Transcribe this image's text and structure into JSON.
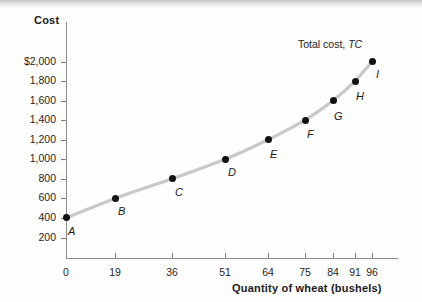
{
  "chart_data": {
    "type": "line",
    "title": "",
    "xlabel": "Quantity of wheat (bushels)",
    "ylabel": "Cost",
    "series_label": "Total cost,",
    "series_symbol": "TC",
    "xlim": [
      0,
      102
    ],
    "ylim": [
      0,
      2150
    ],
    "grid": false,
    "legend_position": "inline-right",
    "xticks": [
      0,
      19,
      36,
      51,
      64,
      75,
      84,
      91,
      96
    ],
    "xtick_labels": [
      "0",
      "19",
      "36",
      "51",
      "64",
      "75",
      "84",
      "91",
      "96"
    ],
    "yticks": [
      200,
      400,
      600,
      800,
      1000,
      1200,
      1400,
      1600,
      1800,
      2000
    ],
    "ytick_labels": [
      "200",
      "400",
      "600",
      "800",
      "1,000",
      "1,200",
      "1,400",
      "1,600",
      "1,800",
      "$2,000"
    ],
    "point_labels": [
      "A",
      "B",
      "C",
      "D",
      "E",
      "F",
      "G",
      "H",
      "I"
    ],
    "x": [
      0,
      19,
      36,
      51,
      64,
      75,
      84,
      91,
      96
    ],
    "values": [
      400,
      600,
      800,
      1000,
      1200,
      1400,
      1600,
      1800,
      2000
    ],
    "points": [
      {
        "label": "A",
        "x": 0,
        "y": 400
      },
      {
        "label": "B",
        "x": 19,
        "y": 600
      },
      {
        "label": "C",
        "x": 36,
        "y": 800
      },
      {
        "label": "D",
        "x": 51,
        "y": 1000
      },
      {
        "label": "E",
        "x": 64,
        "y": 1200
      },
      {
        "label": "F",
        "x": 75,
        "y": 1400
      },
      {
        "label": "G",
        "x": 84,
        "y": 1600
      },
      {
        "label": "H",
        "x": 91,
        "y": 1800
      },
      {
        "label": "I",
        "x": 96,
        "y": 2000
      }
    ],
    "colors": {
      "curve": "#c9c9c9",
      "point": "#121212",
      "axis": "#8a8a8a",
      "text": "#1a1a1a",
      "background": "#fefefe"
    }
  }
}
